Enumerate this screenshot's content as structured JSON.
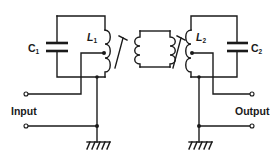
{
  "diagram": {
    "type": "circuit-schematic",
    "labels": {
      "c1": {
        "main": "C",
        "sub": "1"
      },
      "c2": {
        "main": "C",
        "sub": "2"
      },
      "l1": {
        "main": "L",
        "sub": "1"
      },
      "l2": {
        "main": "L",
        "sub": "2"
      },
      "input": "Input",
      "output": "Output"
    },
    "components": [
      {
        "id": "C1",
        "kind": "capacitor",
        "label": "C1"
      },
      {
        "id": "L1",
        "kind": "tapped-inductor-adjustable-core",
        "label": "L1"
      },
      {
        "id": "link",
        "kind": "coupling-link-coils",
        "label": ""
      },
      {
        "id": "L2",
        "kind": "tapped-inductor-adjustable-core",
        "label": "L2"
      },
      {
        "id": "C2",
        "kind": "capacitor",
        "label": "C2"
      },
      {
        "id": "gnd1",
        "kind": "ground"
      },
      {
        "id": "gnd2",
        "kind": "ground"
      }
    ],
    "ports": [
      {
        "name": "Input",
        "terminals": 2,
        "side": "left"
      },
      {
        "name": "Output",
        "terminals": 2,
        "side": "right"
      }
    ],
    "colors": {
      "ink": "#1a1a1a",
      "background": "#ffffff"
    }
  }
}
